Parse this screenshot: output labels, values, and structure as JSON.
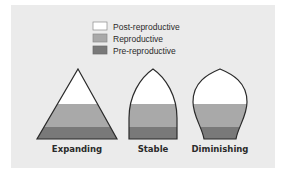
{
  "colors": {
    "background": "#ebebeb",
    "post_reproductive": "#ffffff",
    "reproductive": "#a9a9a9",
    "pre_reproductive": "#797979",
    "outline": "#2a2a2a"
  },
  "legend": {
    "items": [
      {
        "label": "Post-reproductive",
        "color": "#ffffff"
      },
      {
        "label": "Reproductive",
        "color": "#a9a9a9"
      },
      {
        "label": "Pre-reproductive",
        "color": "#797979"
      }
    ]
  },
  "shapes": [
    {
      "label": "Expanding",
      "shape": "triangle"
    },
    {
      "label": "Stable",
      "shape": "bullet"
    },
    {
      "label": "Diminishing",
      "shape": "urn"
    }
  ]
}
